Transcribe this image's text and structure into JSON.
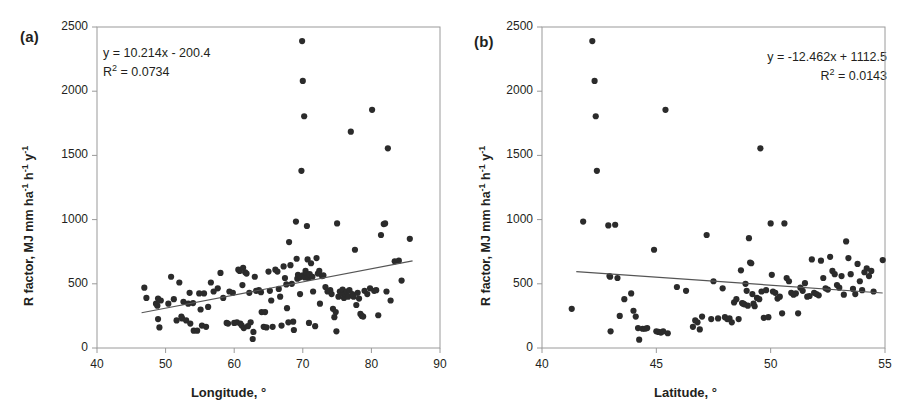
{
  "figure": {
    "background": "#ffffff",
    "point_color": "#2b2b2b",
    "axis_color": "#9a9a9a",
    "trend_color": "#555555",
    "text_color": "#231f20"
  },
  "panels": [
    {
      "id": "a",
      "label": "(a)",
      "equation_line1": "y = 10.214x - 200.4",
      "equation_line2_pre": "R",
      "equation_line2_sup": "2",
      "equation_line2_post": " = 0.0734",
      "ylabel_parts": {
        "p1": "R factor, MJ mm ha",
        "s1": "-1",
        "p2": " h",
        "s2": "-1",
        "p3": " y",
        "s3": "-1"
      },
      "xlabel": "Longitude, °",
      "xticks": [
        "40",
        "50",
        "60",
        "70",
        "80",
        "90"
      ],
      "yticks": [
        "0",
        "500",
        "1000",
        "1500",
        "2000",
        "2500"
      ]
    },
    {
      "id": "b",
      "label": "(b)",
      "equation_line1": "y = -12.462x + 1112.5",
      "equation_line2_pre": "R",
      "equation_line2_sup": "2",
      "equation_line2_post": " = 0.0143",
      "ylabel_parts": {
        "p1": "R factor, MJ mm ha",
        "s1": "-1",
        "p2": " h",
        "s2": "-1",
        "p3": " y",
        "s3": "-1"
      },
      "xlabel": "Latitude, °",
      "xticks": [
        "40",
        "45",
        "50",
        "55"
      ],
      "yticks": [
        "0",
        "500",
        "1000",
        "1500",
        "2000",
        "2500"
      ]
    }
  ],
  "chart_data": [
    {
      "type": "scatter",
      "panel": "a",
      "title": "(a)",
      "xlabel": "Longitude, °",
      "ylabel": "R factor, MJ mm ha-1 h-1 y-1",
      "xlim": [
        40,
        90
      ],
      "ylim": [
        0,
        2500
      ],
      "xticks": [
        40,
        50,
        60,
        70,
        80,
        90
      ],
      "yticks": [
        0,
        500,
        1000,
        1500,
        2000,
        2500
      ],
      "grid": false,
      "legend": "none",
      "annotations": [
        "y = 10.214x - 200.4",
        "R² = 0.0734"
      ],
      "trendline": {
        "slope": 10.214,
        "intercept": -200.4,
        "r2": 0.0734,
        "x_start": 46.5,
        "x_end": 86.0
      },
      "points": [
        [
          46.9,
          470
        ],
        [
          47.2,
          390
        ],
        [
          48.6,
          345
        ],
        [
          48.8,
          330
        ],
        [
          48.9,
          385
        ],
        [
          48.9,
          225
        ],
        [
          49.1,
          160
        ],
        [
          49.3,
          370
        ],
        [
          50.4,
          345
        ],
        [
          50.8,
          555
        ],
        [
          51.2,
          380
        ],
        [
          51.6,
          215
        ],
        [
          52.0,
          510
        ],
        [
          52.3,
          245
        ],
        [
          52.4,
          230
        ],
        [
          52.6,
          360
        ],
        [
          53.0,
          215
        ],
        [
          53.3,
          345
        ],
        [
          53.5,
          430
        ],
        [
          53.6,
          190
        ],
        [
          54.0,
          350
        ],
        [
          54.1,
          135
        ],
        [
          54.6,
          135
        ],
        [
          54.9,
          425
        ],
        [
          55.1,
          300
        ],
        [
          55.3,
          175
        ],
        [
          55.6,
          425
        ],
        [
          55.9,
          165
        ],
        [
          56.2,
          320
        ],
        [
          56.6,
          510
        ],
        [
          57.0,
          440
        ],
        [
          57.6,
          465
        ],
        [
          58.0,
          585
        ],
        [
          58.4,
          390
        ],
        [
          58.9,
          195
        ],
        [
          59.1,
          190
        ],
        [
          59.3,
          440
        ],
        [
          59.8,
          430
        ],
        [
          60.0,
          195
        ],
        [
          60.4,
          200
        ],
        [
          60.6,
          610
        ],
        [
          60.8,
          600
        ],
        [
          60.9,
          190
        ],
        [
          61.1,
          175
        ],
        [
          61.2,
          490
        ],
        [
          61.3,
          625
        ],
        [
          61.4,
          155
        ],
        [
          61.6,
          590
        ],
        [
          61.8,
          580
        ],
        [
          62.0,
          170
        ],
        [
          62.2,
          430
        ],
        [
          62.4,
          200
        ],
        [
          62.7,
          70
        ],
        [
          62.8,
          125
        ],
        [
          63.0,
          555
        ],
        [
          63.2,
          445
        ],
        [
          63.6,
          450
        ],
        [
          63.9,
          435
        ],
        [
          64.0,
          280
        ],
        [
          64.3,
          165
        ],
        [
          64.5,
          280
        ],
        [
          64.7,
          160
        ],
        [
          65.0,
          595
        ],
        [
          65.2,
          445
        ],
        [
          65.4,
          370
        ],
        [
          65.6,
          165
        ],
        [
          66.0,
          610
        ],
        [
          66.3,
          595
        ],
        [
          66.5,
          460
        ],
        [
          66.7,
          400
        ],
        [
          66.9,
          175
        ],
        [
          67.2,
          635
        ],
        [
          67.4,
          545
        ],
        [
          67.6,
          495
        ],
        [
          67.7,
          310
        ],
        [
          67.9,
          200
        ],
        [
          68.0,
          825
        ],
        [
          68.2,
          645
        ],
        [
          68.4,
          500
        ],
        [
          68.6,
          205
        ],
        [
          68.7,
          140
        ],
        [
          69.0,
          985
        ],
        [
          69.1,
          695
        ],
        [
          69.2,
          540
        ],
        [
          69.3,
          570
        ],
        [
          69.5,
          550
        ],
        [
          69.6,
          420
        ],
        [
          69.7,
          555
        ],
        [
          69.8,
          1380
        ],
        [
          69.9,
          2390
        ],
        [
          70.0,
          2080
        ],
        [
          70.0,
          565
        ],
        [
          70.2,
          1805
        ],
        [
          70.3,
          550
        ],
        [
          70.4,
          600
        ],
        [
          70.5,
          580
        ],
        [
          70.6,
          950
        ],
        [
          70.7,
          690
        ],
        [
          70.8,
          545
        ],
        [
          70.9,
          195
        ],
        [
          71.0,
          575
        ],
        [
          71.2,
          660
        ],
        [
          71.4,
          555
        ],
        [
          71.5,
          440
        ],
        [
          71.8,
          170
        ],
        [
          72.0,
          700
        ],
        [
          72.2,
          580
        ],
        [
          72.4,
          600
        ],
        [
          72.5,
          345
        ],
        [
          72.8,
          560
        ],
        [
          73.0,
          565
        ],
        [
          73.3,
          475
        ],
        [
          73.6,
          440
        ],
        [
          74.0,
          450
        ],
        [
          74.2,
          420
        ],
        [
          74.4,
          305
        ],
        [
          74.6,
          240
        ],
        [
          74.8,
          280
        ],
        [
          74.9,
          130
        ],
        [
          75.0,
          970
        ],
        [
          75.2,
          400
        ],
        [
          75.4,
          440
        ],
        [
          75.6,
          425
        ],
        [
          75.8,
          455
        ],
        [
          76.0,
          390
        ],
        [
          76.2,
          420
        ],
        [
          76.4,
          440
        ],
        [
          76.6,
          400
        ],
        [
          76.8,
          450
        ],
        [
          77.0,
          1685
        ],
        [
          77.2,
          420
        ],
        [
          77.4,
          400
        ],
        [
          77.6,
          765
        ],
        [
          77.8,
          335
        ],
        [
          78.0,
          430
        ],
        [
          78.2,
          385
        ],
        [
          78.4,
          265
        ],
        [
          78.6,
          250
        ],
        [
          78.8,
          245
        ],
        [
          79.0,
          445
        ],
        [
          79.4,
          420
        ],
        [
          79.8,
          465
        ],
        [
          80.1,
          1855
        ],
        [
          80.4,
          445
        ],
        [
          80.7,
          450
        ],
        [
          81.0,
          255
        ],
        [
          81.4,
          880
        ],
        [
          81.8,
          965
        ],
        [
          82.0,
          970
        ],
        [
          82.2,
          440
        ],
        [
          82.4,
          1555
        ],
        [
          82.8,
          370
        ],
        [
          83.4,
          675
        ],
        [
          84.0,
          680
        ],
        [
          84.4,
          525
        ],
        [
          85.6,
          850
        ]
      ]
    },
    {
      "type": "scatter",
      "panel": "b",
      "title": "(b)",
      "xlabel": "Latitude, °",
      "ylabel": "R factor, MJ mm ha-1 h-1 y-1",
      "xlim": [
        40,
        55
      ],
      "ylim": [
        0,
        2500
      ],
      "xticks": [
        40,
        45,
        50,
        55
      ],
      "yticks": [
        0,
        500,
        1000,
        1500,
        2000,
        2500
      ],
      "grid": false,
      "legend": "none",
      "annotations": [
        "y = -12.462x + 1112.5",
        "R² = 0.0143"
      ],
      "trendline": {
        "slope": -12.462,
        "intercept": 1112.5,
        "r2": 0.0143,
        "x_start": 41.5,
        "x_end": 54.9
      },
      "points": [
        [
          41.3,
          305
        ],
        [
          41.8,
          985
        ],
        [
          42.2,
          2390
        ],
        [
          42.3,
          2080
        ],
        [
          42.35,
          1805
        ],
        [
          42.4,
          1380
        ],
        [
          42.9,
          955
        ],
        [
          42.95,
          560
        ],
        [
          42.98,
          555
        ],
        [
          43.0,
          130
        ],
        [
          43.2,
          960
        ],
        [
          43.3,
          545
        ],
        [
          43.4,
          250
        ],
        [
          43.6,
          380
        ],
        [
          43.9,
          425
        ],
        [
          44.0,
          290
        ],
        [
          44.1,
          245
        ],
        [
          44.2,
          155
        ],
        [
          44.25,
          65
        ],
        [
          44.4,
          150
        ],
        [
          44.5,
          150
        ],
        [
          44.6,
          155
        ],
        [
          44.9,
          765
        ],
        [
          45.0,
          130
        ],
        [
          45.1,
          125
        ],
        [
          45.2,
          120
        ],
        [
          45.3,
          130
        ],
        [
          45.4,
          1855
        ],
        [
          45.5,
          115
        ],
        [
          45.9,
          475
        ],
        [
          46.3,
          445
        ],
        [
          46.6,
          165
        ],
        [
          46.7,
          215
        ],
        [
          46.8,
          200
        ],
        [
          46.9,
          145
        ],
        [
          47.0,
          245
        ],
        [
          47.2,
          880
        ],
        [
          47.4,
          225
        ],
        [
          47.5,
          520
        ],
        [
          47.7,
          230
        ],
        [
          47.9,
          465
        ],
        [
          48.0,
          240
        ],
        [
          48.1,
          225
        ],
        [
          48.2,
          230
        ],
        [
          48.3,
          200
        ],
        [
          48.4,
          355
        ],
        [
          48.5,
          380
        ],
        [
          48.6,
          225
        ],
        [
          48.7,
          605
        ],
        [
          48.75,
          350
        ],
        [
          48.8,
          345
        ],
        [
          48.85,
          340
        ],
        [
          48.9,
          500
        ],
        [
          48.95,
          445
        ],
        [
          49.0,
          330
        ],
        [
          49.05,
          855
        ],
        [
          49.1,
          665
        ],
        [
          49.15,
          660
        ],
        [
          49.2,
          420
        ],
        [
          49.25,
          345
        ],
        [
          49.3,
          325
        ],
        [
          49.4,
          390
        ],
        [
          49.5,
          380
        ],
        [
          49.55,
          1555
        ],
        [
          49.6,
          440
        ],
        [
          49.7,
          235
        ],
        [
          49.8,
          450
        ],
        [
          49.9,
          240
        ],
        [
          50.0,
          970
        ],
        [
          50.05,
          570
        ],
        [
          50.1,
          440
        ],
        [
          50.2,
          430
        ],
        [
          50.3,
          385
        ],
        [
          50.4,
          400
        ],
        [
          50.5,
          270
        ],
        [
          50.6,
          970
        ],
        [
          50.7,
          545
        ],
        [
          50.8,
          520
        ],
        [
          50.9,
          430
        ],
        [
          51.0,
          415
        ],
        [
          51.1,
          425
        ],
        [
          51.2,
          270
        ],
        [
          51.3,
          470
        ],
        [
          51.4,
          445
        ],
        [
          51.5,
          505
        ],
        [
          51.6,
          400
        ],
        [
          51.7,
          405
        ],
        [
          51.8,
          690
        ],
        [
          51.9,
          430
        ],
        [
          52.0,
          420
        ],
        [
          52.1,
          410
        ],
        [
          52.2,
          680
        ],
        [
          52.3,
          545
        ],
        [
          52.4,
          465
        ],
        [
          52.5,
          455
        ],
        [
          52.6,
          710
        ],
        [
          52.7,
          600
        ],
        [
          52.8,
          575
        ],
        [
          52.9,
          490
        ],
        [
          53.0,
          470
        ],
        [
          53.1,
          560
        ],
        [
          53.2,
          415
        ],
        [
          53.3,
          830
        ],
        [
          53.4,
          700
        ],
        [
          53.5,
          575
        ],
        [
          53.6,
          460
        ],
        [
          53.7,
          420
        ],
        [
          53.8,
          655
        ],
        [
          53.9,
          520
        ],
        [
          54.0,
          450
        ],
        [
          54.1,
          590
        ],
        [
          54.2,
          620
        ],
        [
          54.3,
          560
        ],
        [
          54.4,
          600
        ],
        [
          54.5,
          440
        ],
        [
          54.9,
          685
        ]
      ]
    }
  ]
}
